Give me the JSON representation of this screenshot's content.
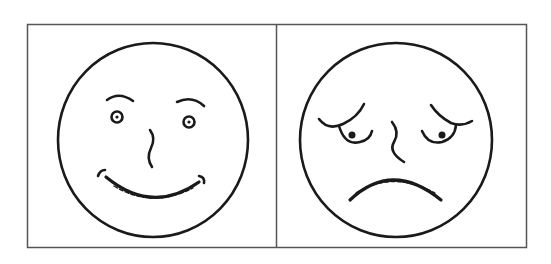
{
  "figure": {
    "panels": [
      {
        "label": "happy-face",
        "expression": "smiling"
      },
      {
        "label": "sad-face",
        "expression": "worried / sad"
      }
    ],
    "stroke_color": "#1a1a1a",
    "border_color": "#555555",
    "background": "#ffffff"
  }
}
